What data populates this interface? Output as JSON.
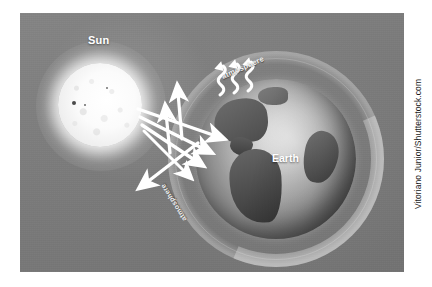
{
  "figure": {
    "alt_title": "Greenhouse effect diagram",
    "background_color": "#7d7d7d",
    "page_background": "#ffffff"
  },
  "labels": {
    "sun": "Sun",
    "earth": "Earth",
    "atmosphere_top": "atmosphere",
    "atmosphere_bottom": "atmosphere"
  },
  "credit": {
    "text": "Vitoriano Junior/Shutterstock.com"
  },
  "icons": {
    "sun": "sun-icon",
    "globe": "globe-icon",
    "incoming-ray": "incoming-solar-ray-arrow-icon",
    "reflected-ray": "reflected-ray-arrow-icon",
    "heat-wave": "heat-radiation-wavy-arrow-icon"
  },
  "colors": {
    "plate_gray": "#7d7d7d",
    "arrow_white": "#ffffff",
    "label_white": "#ffffff",
    "credit_black": "#1a1a1a",
    "land_dark": "#4f4f4f"
  },
  "elements": {
    "incoming_rays_count": 4,
    "upward_arrows_count": 2,
    "heat_wave_arrows_count": 3,
    "reflected_arrows_count": 1,
    "sunspots_count": 3
  }
}
